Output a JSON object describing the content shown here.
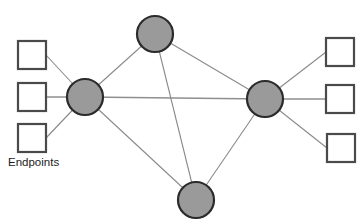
{
  "diagram": {
    "caption": {
      "endpoints_label": "Endpoints",
      "x": 8,
      "y": 166
    },
    "colors": {
      "node_fill": "#9a9a9a",
      "node_stroke": "#2b2b2b",
      "endpoint_fill": "#ffffff",
      "endpoint_stroke": "#4a4a4a",
      "edge_stroke": "#8a8a8a",
      "background": "#ffffff",
      "text": "#1c1c1c"
    },
    "nodes": [
      {
        "id": "core-left",
        "label": "",
        "cx": 85,
        "cy": 97,
        "r": 18,
        "shape": "circle"
      },
      {
        "id": "core-top",
        "label": "",
        "cx": 155,
        "cy": 34,
        "r": 18,
        "shape": "circle"
      },
      {
        "id": "core-right",
        "label": "",
        "cx": 265,
        "cy": 99,
        "r": 18,
        "shape": "circle"
      },
      {
        "id": "core-bottom",
        "label": "",
        "cx": 196,
        "cy": 200,
        "r": 18,
        "shape": "circle"
      }
    ],
    "endpoints": [
      {
        "id": "endpoint-left-top",
        "label": "",
        "x": 18,
        "y": 41,
        "w": 28,
        "h": 28,
        "shape": "square",
        "side": "left"
      },
      {
        "id": "endpoint-left-middle",
        "label": "",
        "x": 18,
        "y": 83,
        "w": 28,
        "h": 28,
        "shape": "square",
        "side": "left"
      },
      {
        "id": "endpoint-left-bottom",
        "label": "",
        "x": 18,
        "y": 124,
        "w": 28,
        "h": 28,
        "shape": "square",
        "side": "left"
      },
      {
        "id": "endpoint-right-top",
        "label": "",
        "x": 326,
        "y": 38,
        "w": 28,
        "h": 28,
        "shape": "square",
        "side": "right"
      },
      {
        "id": "endpoint-right-middle",
        "label": "",
        "x": 326,
        "y": 85,
        "w": 28,
        "h": 28,
        "shape": "square",
        "side": "right"
      },
      {
        "id": "endpoint-right-bottom",
        "label": "",
        "x": 327,
        "y": 134,
        "w": 28,
        "h": 28,
        "shape": "square",
        "side": "right"
      }
    ],
    "core_edges": [
      {
        "from": "core-left",
        "to": "core-top",
        "x1": 85,
        "y1": 97,
        "x2": 155,
        "y2": 34,
        "weight": "thin"
      },
      {
        "from": "core-left",
        "to": "core-right",
        "x1": 85,
        "y1": 97,
        "x2": 265,
        "y2": 99,
        "weight": "thick"
      },
      {
        "from": "core-left",
        "to": "core-bottom",
        "x1": 85,
        "y1": 97,
        "x2": 196,
        "y2": 200,
        "weight": "thin"
      },
      {
        "from": "core-top",
        "to": "core-right",
        "x1": 155,
        "y1": 34,
        "x2": 265,
        "y2": 99,
        "weight": "thin"
      },
      {
        "from": "core-top",
        "to": "core-bottom",
        "x1": 155,
        "y1": 34,
        "x2": 196,
        "y2": 200,
        "weight": "thin"
      },
      {
        "from": "core-right",
        "to": "core-bottom",
        "x1": 265,
        "y1": 99,
        "x2": 196,
        "y2": 200,
        "weight": "thin"
      }
    ],
    "access_edges": [
      {
        "from": "endpoint-left-top",
        "to": "core-left",
        "x1": 46,
        "y1": 55,
        "x2": 85,
        "y2": 97,
        "weight": "thin"
      },
      {
        "from": "endpoint-left-middle",
        "to": "core-left",
        "x1": 46,
        "y1": 97,
        "x2": 85,
        "y2": 97,
        "weight": "thick"
      },
      {
        "from": "endpoint-left-bottom",
        "to": "core-left",
        "x1": 46,
        "y1": 138,
        "x2": 85,
        "y2": 97,
        "weight": "thin"
      },
      {
        "from": "endpoint-right-top",
        "to": "core-right",
        "x1": 326,
        "y1": 52,
        "x2": 265,
        "y2": 99,
        "weight": "thin"
      },
      {
        "from": "endpoint-right-middle",
        "to": "core-right",
        "x1": 326,
        "y1": 99,
        "x2": 265,
        "y2": 99,
        "weight": "thick"
      },
      {
        "from": "endpoint-right-bottom",
        "to": "core-right",
        "x1": 327,
        "y1": 148,
        "x2": 265,
        "y2": 99,
        "weight": "thin"
      }
    ]
  }
}
